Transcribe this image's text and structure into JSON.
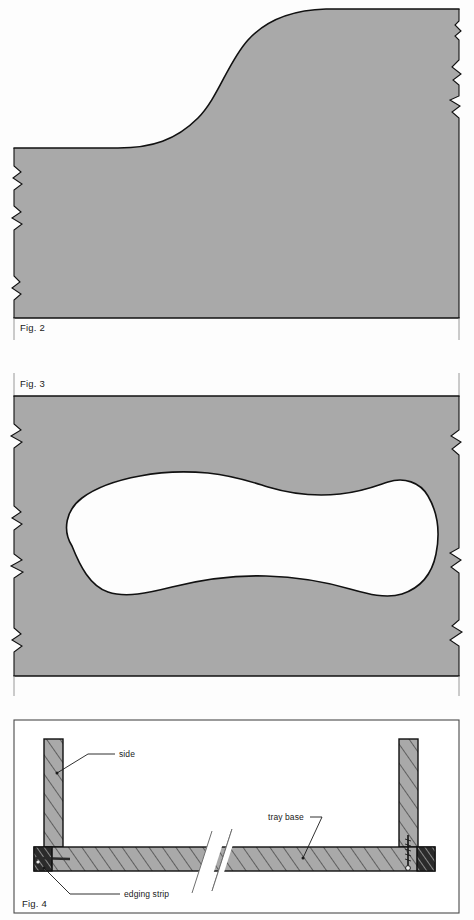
{
  "document": {
    "type": "technical-drawing-sheet",
    "page_background": "#fdfdfd",
    "figure_count": 3
  },
  "palette": {
    "material_gray": "#a9a9a9",
    "hatch_gray": "#a9a9a9",
    "edging_dark": "#2b2b2b",
    "outline_black": "#111111",
    "panel_rule_gray": "#8d8d8d",
    "white": "#ffffff"
  },
  "figures": [
    {
      "id": "fig-2",
      "caption": "Fig. 2",
      "description": "Side elevation of tray base showing S-curve profile",
      "fill": "#a9a9a9",
      "has_break_edges": true,
      "break_edge_sides": [
        "left",
        "right"
      ]
    },
    {
      "id": "fig-3",
      "caption": "Fig. 3",
      "description": "Plan view of tray base with kidney-shaped cut-out aperture",
      "fill": "#a9a9a9",
      "cutout_fill": "#ffffff",
      "has_break_edges": true,
      "break_edge_sides": [
        "left",
        "right"
      ]
    },
    {
      "id": "fig-4",
      "caption": "Fig. 4",
      "description": "Cross-section through tray showing sides, base and edging strips",
      "framed": true,
      "callouts": [
        {
          "id": "callout-side",
          "label": "side",
          "anchor": "left-upright"
        },
        {
          "id": "callout-tray-base",
          "label": "tray base",
          "anchor": "base-slab"
        },
        {
          "id": "callout-edging-strip",
          "label": "edging strip",
          "anchor": "left-edging-block"
        }
      ],
      "components": [
        {
          "id": "left-upright",
          "name": "side",
          "hatched": true,
          "fill": "#a9a9a9"
        },
        {
          "id": "right-upright",
          "name": "side",
          "hatched": true,
          "fill": "#a9a9a9"
        },
        {
          "id": "base-slab",
          "name": "tray base",
          "hatched": true,
          "fill": "#a9a9a9"
        },
        {
          "id": "left-edging-block",
          "name": "edging strip",
          "hatched": true,
          "fill": "#2b2b2b"
        },
        {
          "id": "right-edging-block",
          "name": "edging strip",
          "hatched": true,
          "fill": "#2b2b2b"
        },
        {
          "id": "fastener-screw",
          "name": "screw",
          "hatched": false,
          "fill": "#1a1a1a"
        }
      ],
      "break_symbol": "double-diagonal-break-line"
    }
  ]
}
